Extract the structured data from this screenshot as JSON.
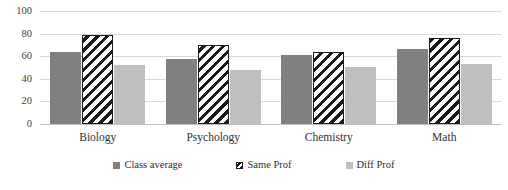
{
  "chart_data": {
    "type": "bar",
    "title": "",
    "xlabel": "",
    "ylabel": "",
    "ylim": [
      0,
      100
    ],
    "yticks": [
      0,
      20,
      40,
      60,
      80,
      100
    ],
    "grid": true,
    "legend_position": "bottom",
    "categories": [
      "Biology",
      "Psychology",
      "Chemistry",
      "Math"
    ],
    "series": [
      {
        "name": "Class average",
        "color": "#808080",
        "pattern": "solid",
        "values": [
          64,
          57,
          61,
          66
        ]
      },
      {
        "name": "Same Prof",
        "color": "#1a1a1a",
        "pattern": "diagonal",
        "values": [
          79,
          70,
          64,
          76
        ]
      },
      {
        "name": "Diff Prof",
        "color": "#bfbfbf",
        "pattern": "solid",
        "values": [
          52,
          48,
          50,
          53
        ]
      }
    ]
  },
  "axis": {
    "y_tick_labels": [
      "100",
      "80",
      "60",
      "40",
      "20",
      "0"
    ]
  },
  "legend": {
    "items": [
      {
        "label": "Class average"
      },
      {
        "label": "Same Prof"
      },
      {
        "label": "Diff Prof"
      }
    ]
  }
}
